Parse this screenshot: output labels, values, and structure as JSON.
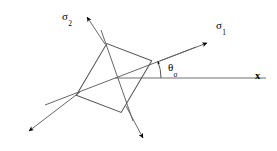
{
  "figure": {
    "type": "principal-stress-element-diagram",
    "background_color": "#ffffff",
    "line_color": "#555555",
    "arrow_color": "#000000",
    "text_color": "#000000"
  },
  "labels": {
    "sigma1": {
      "symbol": "σ",
      "subscript": "1"
    },
    "sigma2": {
      "symbol": "σ",
      "subscript": "2"
    },
    "theta": {
      "symbol": "θ",
      "subscript": "σ"
    },
    "x_axis": {
      "symbol": "x",
      "subscript": ""
    }
  },
  "geometry": {
    "element_center": {
      "x": 114,
      "y": 78
    },
    "element_side": 57,
    "element_rotation_deg": 21,
    "sigma1_axis_angle_deg": 21,
    "theta_arc_radius": 46,
    "x_axis": {
      "start_x": 115,
      "end_x": 266,
      "y": 78
    }
  }
}
